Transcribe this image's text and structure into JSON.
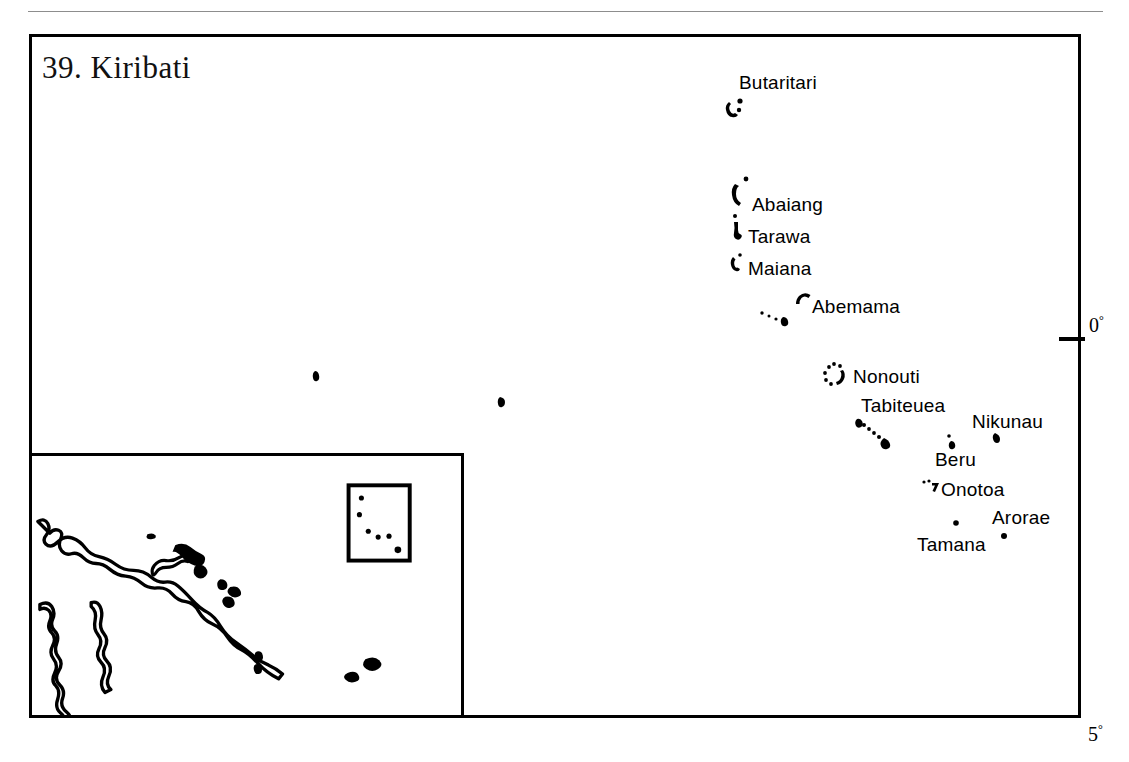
{
  "page": {
    "running_head": "",
    "background_color": "#ffffff",
    "ink_color": "#000000"
  },
  "map": {
    "title": "39. Kiribati",
    "frame": {
      "x": 29,
      "y": 34,
      "width": 1052,
      "height": 684
    },
    "latitude_labels": [
      {
        "name": "equator",
        "value": "0",
        "degree_symbol": "°",
        "x": 1089,
        "y": 313
      },
      {
        "name": "south-5",
        "value": "5",
        "degree_symbol": "°",
        "x": 1088,
        "y": 722
      }
    ],
    "islands": [
      {
        "id": "butaritari",
        "label": "Butaritari",
        "label_x": 739,
        "label_y": 72,
        "shape": "atoll-broken-ring",
        "shape_x": 726,
        "shape_y": 100
      },
      {
        "id": "abaiang",
        "label": "Abaiang",
        "label_x": 752,
        "label_y": 194,
        "shape": "atoll-crescent",
        "shape_x": 732,
        "shape_y": 183
      },
      {
        "id": "tarawa",
        "label": "Tarawa",
        "label_x": 748,
        "label_y": 226,
        "shape": "atoll-hook",
        "shape_x": 732,
        "shape_y": 223
      },
      {
        "id": "maiana",
        "label": "Maiana",
        "label_x": 748,
        "label_y": 258,
        "shape": "atoll-small-ring",
        "shape_x": 731,
        "shape_y": 257
      },
      {
        "id": "abemama",
        "label": "Abemama",
        "label_x": 812,
        "label_y": 296,
        "shape": "atoll-hook",
        "shape_x": 796,
        "shape_y": 294
      },
      {
        "id": "kuria-aranuka",
        "label": "",
        "label_x": 0,
        "label_y": 0,
        "shape": "dot-chain-small",
        "shape_x": 760,
        "shape_y": 312
      },
      {
        "id": "nonouti",
        "label": "Nonouti",
        "label_x": 853,
        "label_y": 366,
        "shape": "atoll-dotted-ring",
        "shape_x": 824,
        "shape_y": 363
      },
      {
        "id": "tabiteuea",
        "label": "Tabiteuea",
        "label_x": 861,
        "label_y": 395,
        "shape": "dotted-chain-diagonal",
        "shape_x": 856,
        "shape_y": 418
      },
      {
        "id": "nikunau",
        "label": "Nikunau",
        "label_x": 972,
        "label_y": 411,
        "shape": "dot",
        "shape_x": 995,
        "shape_y": 437
      },
      {
        "id": "beru",
        "label": "Beru",
        "label_x": 935,
        "label_y": 449,
        "shape": "dot",
        "shape_x": 948,
        "shape_y": 440
      },
      {
        "id": "onotoa",
        "label": "Onotoa",
        "label_x": 941,
        "label_y": 479,
        "shape": "atoll-tiny-hook",
        "shape_x": 922,
        "shape_y": 480
      },
      {
        "id": "arorae",
        "label": "Arorae",
        "label_x": 992,
        "label_y": 507,
        "shape": "dot",
        "shape_x": 1002,
        "shape_y": 534
      },
      {
        "id": "tamana",
        "label": "Tamana",
        "label_x": 917,
        "label_y": 534,
        "shape": "dot",
        "shape_x": 954,
        "shape_y": 522
      },
      {
        "id": "banaba",
        "label": "",
        "label_x": 0,
        "label_y": 0,
        "shape": "dot",
        "shape_x": 316,
        "shape_y": 375
      },
      {
        "id": "unnamed-islet",
        "label": "",
        "label_x": 0,
        "label_y": 0,
        "shape": "dot",
        "shape_x": 502,
        "shape_y": 400
      }
    ]
  },
  "inset": {
    "frame": {
      "x": 29,
      "y": 453,
      "width": 435,
      "height": 265
    },
    "locator_box": {
      "x": 350,
      "y": 483,
      "width": 62,
      "height": 77
    },
    "locator_dots": 6,
    "landmasses": [
      "New Guinea",
      "Solomon Islands",
      "Vanuatu",
      "Fiji",
      "Australia (Cape York)"
    ]
  }
}
